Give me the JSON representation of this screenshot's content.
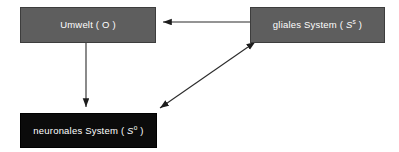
{
  "diagram": {
    "background_color": "#ffffff",
    "nodes": [
      {
        "id": "umwelt",
        "label": "Umwelt ( O )",
        "text_before": "Umwelt ( O )",
        "symbol": "",
        "symbol_sup": "",
        "text_after": "",
        "fill_color": "#5e5e5e",
        "border_color": "#3d3d3d",
        "text_color": "#ffffff",
        "x": 20,
        "y": 7,
        "width": 136,
        "height": 36
      },
      {
        "id": "glial",
        "label": "gliales System ( S s )",
        "text_before": "gliales System ( ",
        "symbol": "S",
        "symbol_sup": "s",
        "text_after": " )",
        "fill_color": "#5e5e5e",
        "border_color": "#3d3d3d",
        "text_color": "#ffffff",
        "x": 250,
        "y": 7,
        "width": 135,
        "height": 36
      },
      {
        "id": "neuronal",
        "label": "neuronales System ( S o )",
        "text_before": "neuronales System ( ",
        "symbol": "S",
        "symbol_sup": "o",
        "text_after": " )",
        "fill_color": "#0b0b0b",
        "border_color": "#000000",
        "text_color": "#ffffff",
        "x": 20,
        "y": 113,
        "width": 137,
        "height": 35
      }
    ],
    "edges": [
      {
        "id": "glial-to-umwelt",
        "from": "glial",
        "to": "umwelt",
        "direction": "one-way",
        "orientation": "horizontal",
        "color": "#2b2b2b",
        "x1": 250,
        "y1": 22,
        "x2": 160,
        "y2": 22
      },
      {
        "id": "umwelt-to-neuronal",
        "from": "umwelt",
        "to": "neuronal",
        "direction": "one-way",
        "orientation": "vertical",
        "color": "#2b2b2b",
        "x1": 86,
        "y1": 43,
        "x2": 86,
        "y2": 110
      },
      {
        "id": "glial-neuronal-bidirectional",
        "from": "glial",
        "to": "neuronal",
        "direction": "two-way",
        "orientation": "diagonal",
        "color": "#2b2b2b",
        "x1": 251,
        "y1": 45,
        "x2": 157,
        "y2": 110
      }
    ]
  }
}
